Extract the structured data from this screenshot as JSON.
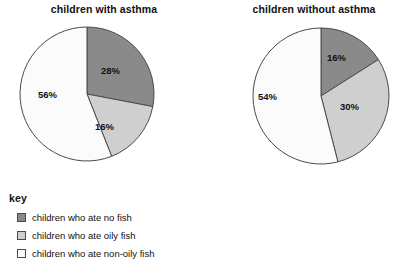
{
  "colors": {
    "no_fish": "#8a8a8a",
    "oily_fish": "#cfcfcf",
    "non_oily_fish": "#fbfbfb",
    "outline": "#4a4a4a",
    "background": "#ffffff",
    "text": "#111111"
  },
  "charts": {
    "left": {
      "title": "children with asthma",
      "labels": {
        "no_fish": "28%",
        "oily_fish": "16%",
        "non_oily_fish": "56%"
      }
    },
    "right": {
      "title": "children without asthma",
      "labels": {
        "no_fish": "16%",
        "oily_fish": "30%",
        "non_oily_fish": "54%"
      }
    }
  },
  "legend": {
    "title": "key",
    "items": [
      {
        "label": "children who ate no fish",
        "color": "#8a8a8a"
      },
      {
        "label": "children who ate oily fish",
        "color": "#cfcfcf"
      },
      {
        "label": "children who ate non-oily fish",
        "color": "#fbfbfb"
      }
    ]
  },
  "chart_data": [
    {
      "type": "pie",
      "title": "children with asthma",
      "categories": [
        "children who ate no fish",
        "children who ate oily fish",
        "children who ate non-oily fish"
      ],
      "values": [
        28,
        16,
        56
      ],
      "value_labels": [
        "28%",
        "16%",
        "56%"
      ],
      "units": "percent",
      "start_angle_deg": 0,
      "direction": "clockwise",
      "colors": [
        "#8a8a8a",
        "#cfcfcf",
        "#fbfbfb"
      ],
      "legend": "below",
      "grid": false
    },
    {
      "type": "pie",
      "title": "children without asthma",
      "categories": [
        "children who ate no fish",
        "children who ate oily fish",
        "children who ate non-oily fish"
      ],
      "values": [
        16,
        30,
        54
      ],
      "value_labels": [
        "16%",
        "30%",
        "54%"
      ],
      "units": "percent",
      "start_angle_deg": 0,
      "direction": "clockwise",
      "colors": [
        "#8a8a8a",
        "#cfcfcf",
        "#fbfbfb"
      ],
      "legend": "below",
      "grid": false
    }
  ]
}
